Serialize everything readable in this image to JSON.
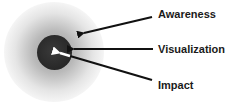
{
  "diagram": {
    "labels": {
      "awareness": "Awareness",
      "visualization": "Visualization",
      "impact": "Impact"
    },
    "colors": {
      "core": "#2a2a2a",
      "arrow": "#111111",
      "inner_arrow": "#ffffff",
      "text": "#1a1a1a"
    }
  }
}
